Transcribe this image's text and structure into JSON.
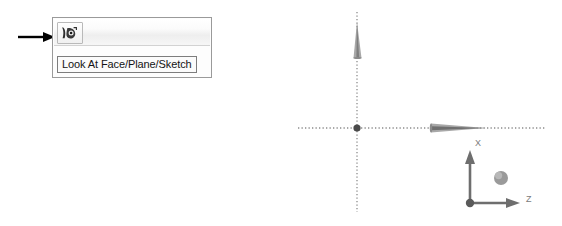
{
  "annotation": {
    "arrow_name": "pointer-arrow",
    "arrow_color": "#000000",
    "direction": "right"
  },
  "toolbar": {
    "panel_name": "view-toolbar-panel",
    "background": "#fdfdfd",
    "border_color": "#9a9a9a",
    "buttons": [
      {
        "id": "look-at-face-plane-sketch",
        "icon": "look-at-face-plane-sketch-icon",
        "label": "Look At Face/Plane/Sketch",
        "state": "hover"
      }
    ]
  },
  "tooltip": {
    "text": "Look At Face/Plane/Sketch",
    "border_color": "#7d7d7d",
    "background": "#fbfbfb",
    "text_color": "#141414"
  },
  "viewport": {
    "name": "cad-3d-viewport",
    "background": "#ffffff",
    "construction_axes": {
      "style": "dotted",
      "color": "#8c8c8c",
      "horizontal": {
        "y": 128,
        "x_start": 298,
        "x_end": 546
      },
      "vertical": {
        "x": 357,
        "y_start": 12,
        "y_end": 212
      }
    },
    "origin": {
      "label": "origin-point",
      "x": 357,
      "y": 128,
      "color": "#4a4a4a"
    },
    "arrows": [
      {
        "name": "vertical-cone-arrow",
        "orientation": "up",
        "color": "#9e9e9e"
      },
      {
        "name": "horizontal-cone-arrow",
        "orientation": "right",
        "color": "#9e9e9e"
      }
    ],
    "triad": {
      "name": "axis-triad",
      "origin_color": "#5a5a5a",
      "axis_color": "#6e6e6e",
      "sphere_color": "#9a9a9a",
      "axes": [
        {
          "id": "x",
          "label": "X",
          "direction": "up"
        },
        {
          "id": "z",
          "label": "Z",
          "direction": "right"
        },
        {
          "id": "y",
          "label": "",
          "direction": "toward-viewer"
        }
      ]
    }
  }
}
